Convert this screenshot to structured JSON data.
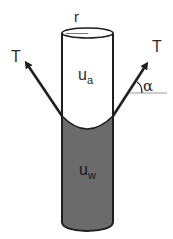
{
  "diagram": {
    "type": "capillary-tube-meniscus",
    "labels": {
      "radius": "r",
      "tension_left": "T",
      "tension_right": "T",
      "angle": "α",
      "air_pressure_main": "u",
      "air_pressure_sub": "a",
      "water_pressure_main": "u",
      "water_pressure_sub": "w"
    },
    "colors": {
      "stroke": "#1e1e1e",
      "water_fill": "#6b6b6b",
      "air_fill": "#ffffff",
      "reference_line": "#9a9a9a"
    }
  }
}
